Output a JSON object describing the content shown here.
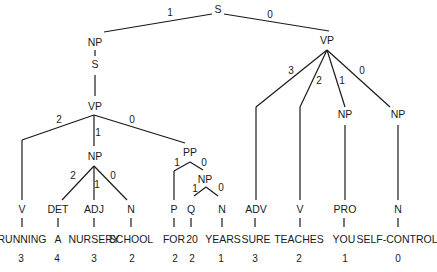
{
  "diagram": {
    "type": "parse-tree",
    "root": "S",
    "nodes": {
      "s_root": "S",
      "np_subject": "NP",
      "s_embedded": "S",
      "vp_embedded": "VP",
      "vp_main": "VP",
      "v_running": "V",
      "np_object": "NP",
      "pp": "PP",
      "det": "DET",
      "adj": "ADJ",
      "n_school": "N",
      "p_for": "P",
      "np_pp": "NP",
      "q": "Q",
      "n_years": "N",
      "adv": "ADV",
      "v_teaches": "V",
      "np_you": "NP",
      "np_selfcontrol": "NP",
      "pro": "PRO",
      "n_selfcontrol": "N"
    },
    "edge_labels": {
      "s_to_np": "1",
      "s_to_vp": "0",
      "vpe_to_v": "2",
      "vpe_to_np": "1",
      "vpe_to_pp": "0",
      "np_to_det": "2",
      "np_to_adj": "1",
      "np_to_n": "0",
      "pp_to_p": "1",
      "pp_to_np": "0",
      "nppp_to_q": "1",
      "nppp_to_n": "0",
      "vp_to_adv": "3",
      "vp_to_v": "2",
      "vp_to_np1": "1",
      "vp_to_np0": "0"
    },
    "words": [
      {
        "pos": "V",
        "word": "RUNNING",
        "depth": "3"
      },
      {
        "pos": "DET",
        "word": "A",
        "depth": "4"
      },
      {
        "pos": "ADJ",
        "word": "NURSERY",
        "depth": "3"
      },
      {
        "pos": "N",
        "word": "SCHOOL",
        "depth": "2"
      },
      {
        "pos": "P",
        "word": "FOR",
        "depth": "2"
      },
      {
        "pos": "Q",
        "word": "20",
        "depth": "2"
      },
      {
        "pos": "N",
        "word": "YEARS",
        "depth": "1"
      },
      {
        "pos": "ADV",
        "word": "SURE",
        "depth": "3"
      },
      {
        "pos": "V",
        "word": "TEACHES",
        "depth": "2"
      },
      {
        "pos": "PRO",
        "word": "YOU",
        "depth": "1"
      },
      {
        "pos": "N",
        "word": "SELF-CONTROL",
        "depth": "0"
      }
    ]
  }
}
